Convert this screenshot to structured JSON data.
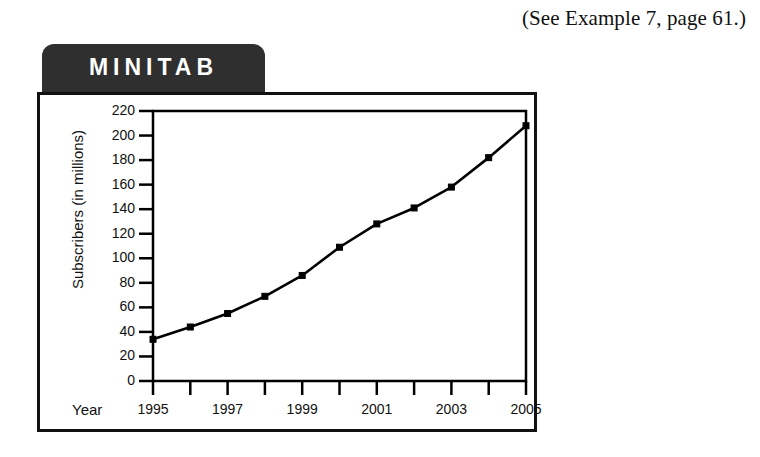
{
  "page": {
    "caption": "(See Example 7, page 61.)"
  },
  "panel": {
    "tab_label": "MINITAB"
  },
  "chart_data": {
    "type": "line",
    "title": "",
    "subtitle": "",
    "xlabel": "Year",
    "ylabel": "Subscribers (in millions)",
    "x": [
      1995,
      1996,
      1997,
      1998,
      1999,
      2000,
      2001,
      2002,
      2003,
      2004,
      2005
    ],
    "values": [
      34,
      44,
      55,
      69,
      86,
      109,
      128,
      141,
      158,
      182,
      208
    ],
    "series": [
      {
        "name": "Subscribers (in millions)",
        "values": [
          34,
          44,
          55,
          69,
          86,
          109,
          128,
          141,
          158,
          182,
          208
        ]
      }
    ],
    "xlim": [
      1995,
      2005
    ],
    "ylim": [
      0,
      220
    ],
    "yticks": [
      0,
      20,
      40,
      60,
      80,
      100,
      120,
      140,
      160,
      180,
      200,
      220
    ],
    "ytick_labels": [
      "0",
      "20",
      "40",
      "60",
      "80",
      "100",
      "120",
      "140",
      "160",
      "180",
      "200",
      "220"
    ],
    "xticks": [
      1995,
      1996,
      1997,
      1998,
      1999,
      2000,
      2001,
      2002,
      2003,
      2004,
      2005
    ],
    "xtick_labels": [
      "1995",
      "",
      "1997",
      "",
      "1999",
      "",
      "2001",
      "",
      "2003",
      "",
      "2005"
    ],
    "xtick_labels_shown": [
      "1995",
      "1997",
      "1999",
      "2001",
      "2003",
      "2005"
    ],
    "grid": false,
    "legend": false,
    "legend_position": "none",
    "marker": "square",
    "line_color": "#000000",
    "marker_color": "#000000"
  },
  "colors": {
    "tab_background": "#2f2f2f",
    "tab_text": "#ffffff",
    "frame": "#111111",
    "plot_line": "#000000",
    "page_background": "#ffffff"
  }
}
